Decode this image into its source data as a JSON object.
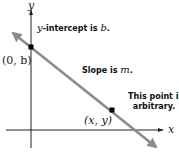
{
  "diagram": {
    "axes": {
      "x_label": "x",
      "y_label": "y"
    },
    "points": {
      "intercept_label": "(0, b)",
      "arbitrary_label": "(x, y)"
    },
    "annotations": {
      "intercept_prefix": "y",
      "intercept_text": "-intercept is ",
      "intercept_var": "b",
      "intercept_suffix": ".",
      "slope_text": "Slope is ",
      "slope_var": "m",
      "slope_suffix": ".",
      "arbitrary_line1": "This point is",
      "arbitrary_line2": "arbitrary."
    },
    "colors": {
      "line": "#8c8c8c",
      "axes": "#222222",
      "points": "#000000"
    }
  }
}
